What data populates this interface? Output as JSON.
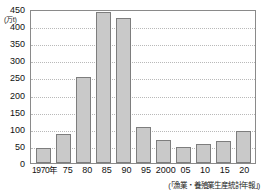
{
  "chart_data": {
    "type": "bar",
    "title": "",
    "xlabel": "",
    "ylabel": "(万t)",
    "ylim": [
      0,
      450
    ],
    "ytick_step": 50,
    "grid": true,
    "legend": "none",
    "source_note": "(「漁業・養殖業生産統計年報」)",
    "categories": [
      "1970年",
      "75",
      "80",
      "85",
      "90",
      "95",
      "2000",
      "05",
      "10",
      "15",
      "20"
    ],
    "values": [
      45,
      85,
      250,
      440,
      425,
      106,
      67,
      48,
      55,
      63,
      93
    ],
    "ytick_labels": [
      "450",
      "400",
      "350",
      "300",
      "250",
      "200",
      "150",
      "100",
      "50",
      "0"
    ],
    "ytick_values": [
      450,
      400,
      350,
      300,
      250,
      200,
      150,
      100,
      50,
      0
    ]
  },
  "colors": {
    "bar_fill": "#c9c9c9",
    "bar_stroke": "#7d7d7d",
    "frame": "#8a8a8a",
    "grid": "#b9b9b9",
    "text": "#111111",
    "background": "#ffffff"
  }
}
